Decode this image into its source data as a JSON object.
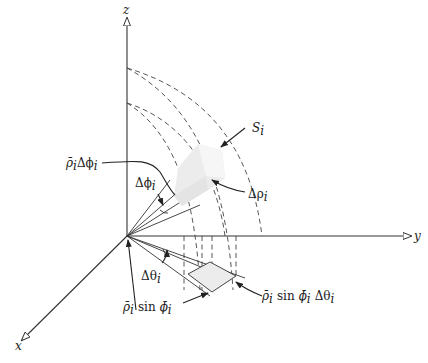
{
  "diagram": {
    "type": "spherical-coordinates-volume-element",
    "axes": {
      "x": "x",
      "y": "y",
      "z": "z"
    },
    "labels": {
      "surface": "S",
      "surface_sub": "i",
      "delta_rho": "Δρ",
      "delta_rho_sub": "i",
      "rho_delta_phi": "ρ̄",
      "rho_delta_phi_sub": "i",
      "rho_delta_phi_rest": "Δϕ",
      "rho_delta_phi_sub2": "i",
      "delta_phi": "Δϕ",
      "delta_phi_sub": "i",
      "delta_theta": "Δθ",
      "delta_theta_sub": "i",
      "rho_sin_phi_a": "ρ̄",
      "rho_sin_phi_a_sub": "i",
      "rho_sin_phi_sin": "sin",
      "rho_sin_phi_b": "ϕ̄",
      "rho_sin_phi_b_sub": "i",
      "rho_sin_phi_dtheta_a": "ρ̄",
      "rho_sin_phi_dtheta_a_sub": "i",
      "rho_sin_phi_dtheta_sin": "sin",
      "rho_sin_phi_dtheta_b": "ϕ̄",
      "rho_sin_phi_dtheta_b_sub": "i",
      "rho_sin_phi_dtheta_c": "Δθ",
      "rho_sin_phi_dtheta_c_sub": "i"
    },
    "colors": {
      "line": "#333333",
      "solid_fill": "#ececec",
      "solid_shade": "#f6f6f6",
      "background": "#ffffff"
    }
  }
}
